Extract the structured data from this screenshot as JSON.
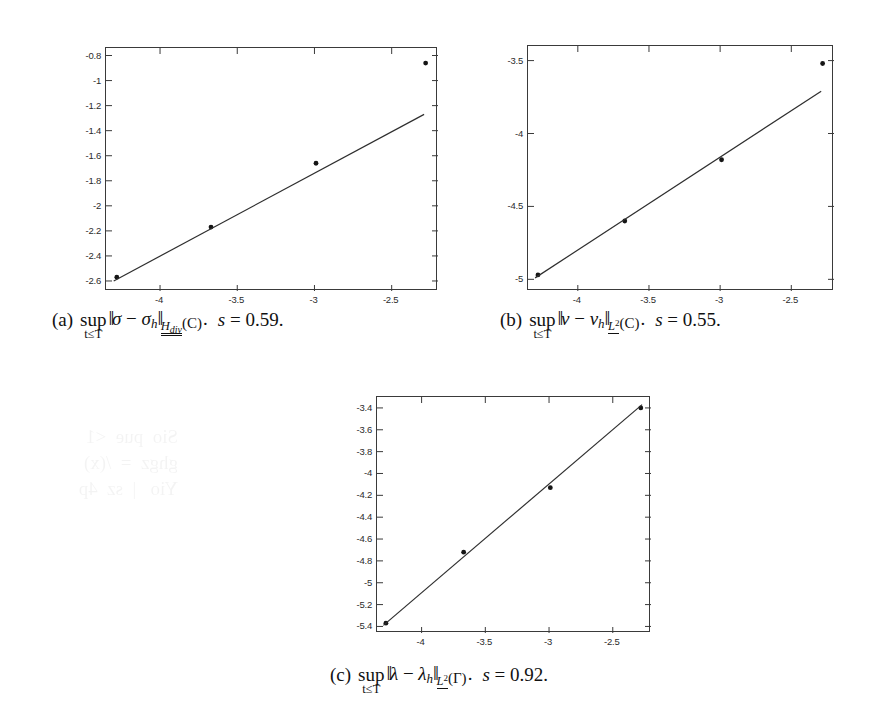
{
  "figure": {
    "kind": "three-panel-convergence-figure",
    "background": "#ffffff",
    "ink": "#1a1a1a"
  },
  "ghost_artifact": {
    "text": "scan bleed-through"
  },
  "panels": [
    {
      "id": "a",
      "caption": {
        "label": "(a)",
        "operator": "sup",
        "operator_sub": "t≤T",
        "norm_arg_1": "σ",
        "minus": "−",
        "norm_arg_2": "σ",
        "norm_arg_2_sub": "h",
        "norm_subscript": "H",
        "norm_subscript_sub": "div",
        "domain": "(C)",
        "period": ".",
        "slope_symbol": "s",
        "slope_eq": "=",
        "slope_value": "0.59",
        "slope_period": "."
      }
    },
    {
      "id": "b",
      "caption": {
        "label": "(b)",
        "operator": "sup",
        "operator_sub": "t≤T",
        "norm_arg_1": "v",
        "minus": "−",
        "norm_arg_2": "v",
        "norm_arg_2_sub": "h",
        "norm_subscript": "L",
        "norm_subscript_sup": "2",
        "domain": "(C)",
        "period": ".",
        "slope_symbol": "s",
        "slope_eq": "=",
        "slope_value": "0.55",
        "slope_period": "."
      }
    },
    {
      "id": "c",
      "caption": {
        "label": "(c)",
        "operator": "sup",
        "operator_sub": "t≤T",
        "norm_arg_1": "λ",
        "minus": "−",
        "norm_arg_2": "λ",
        "norm_arg_2_sub": "h",
        "norm_subscript": "L",
        "norm_subscript_sup": "2",
        "domain": "(Γ)",
        "period": ".",
        "slope_symbol": "s",
        "slope_eq": "=",
        "slope_value": "0.92",
        "slope_period": "."
      }
    }
  ],
  "chart_data": [
    {
      "type": "scatter",
      "panel": "a",
      "title": "",
      "xlabel": "",
      "ylabel": "",
      "xlim": [
        -4.35,
        -2.2
      ],
      "ylim": [
        -2.68,
        -0.74
      ],
      "xticks": [
        -4,
        -3.5,
        -3,
        -2.5
      ],
      "xticklabels": [
        "-4",
        "-3.5",
        "-3",
        "-2.5"
      ],
      "yticks": [
        -0.8,
        -1,
        -1.2,
        -1.4,
        -1.6,
        -1.8,
        -2,
        -2.2,
        -2.4,
        -2.6
      ],
      "yticklabels": [
        "-0.8",
        "-1",
        "-1.2",
        "-1.4",
        "-1.6",
        "-1.8",
        "-2",
        "-2.2",
        "-2.4",
        "-2.6"
      ],
      "grid": false,
      "legend": null,
      "series": [
        {
          "name": "data points",
          "marker": "dot",
          "x": [
            -4.28,
            -3.67,
            -2.99,
            -2.28
          ],
          "y": [
            -2.57,
            -2.17,
            -1.66,
            -0.86
          ]
        },
        {
          "name": "least-squares fit",
          "marker": "line",
          "x": [
            -4.3,
            -2.29
          ],
          "y": [
            -2.6,
            -1.27
          ],
          "slope": 0.59
        }
      ]
    },
    {
      "type": "scatter",
      "panel": "b",
      "title": "",
      "xlabel": "",
      "ylabel": "",
      "xlim": [
        -4.35,
        -2.2
      ],
      "ylim": [
        -5.08,
        -3.4
      ],
      "xticks": [
        -4,
        -3.5,
        -3,
        -2.5
      ],
      "xticklabels": [
        "-4",
        "-3.5",
        "-3",
        "-2.5"
      ],
      "yticks": [
        -3.5,
        -4,
        -4.5,
        -5
      ],
      "yticklabels": [
        "-3.5",
        "-4",
        "-4.5",
        "-5"
      ],
      "grid": false,
      "legend": null,
      "series": [
        {
          "name": "data points",
          "marker": "dot",
          "x": [
            -4.28,
            -3.67,
            -2.99,
            -2.28
          ],
          "y": [
            -4.97,
            -4.6,
            -4.18,
            -3.52
          ]
        },
        {
          "name": "least-squares fit",
          "marker": "line",
          "x": [
            -4.3,
            -2.29
          ],
          "y": [
            -4.99,
            -3.71
          ],
          "slope": 0.55
        }
      ]
    },
    {
      "type": "scatter",
      "panel": "c",
      "title": "",
      "xlabel": "",
      "ylabel": "",
      "xlim": [
        -4.35,
        -2.2
      ],
      "ylim": [
        -5.46,
        -3.3
      ],
      "xticks": [
        -4,
        -3.5,
        -3,
        -2.5
      ],
      "xticklabels": [
        "-4",
        "-3.5",
        "-3",
        "-2.5"
      ],
      "yticks": [
        -3.4,
        -3.6,
        -3.8,
        -4,
        -4.2,
        -4.4,
        -4.6,
        -4.8,
        -5,
        -5.2,
        -5.4
      ],
      "yticklabels": [
        "-3.4",
        "-3.6",
        "-3.8",
        "-4",
        "-4.2",
        "-4.4",
        "-4.6",
        "-4.8",
        "-5",
        "-5.2",
        "-5.4"
      ],
      "grid": false,
      "legend": null,
      "series": [
        {
          "name": "data points",
          "marker": "dot",
          "x": [
            -4.28,
            -3.67,
            -2.99,
            -2.28
          ],
          "y": [
            -5.37,
            -4.72,
            -4.13,
            -3.4
          ]
        },
        {
          "name": "least-squares fit",
          "marker": "line",
          "x": [
            -4.3,
            -2.27
          ],
          "y": [
            -5.39,
            -3.37
          ],
          "slope": 0.92
        }
      ]
    }
  ]
}
